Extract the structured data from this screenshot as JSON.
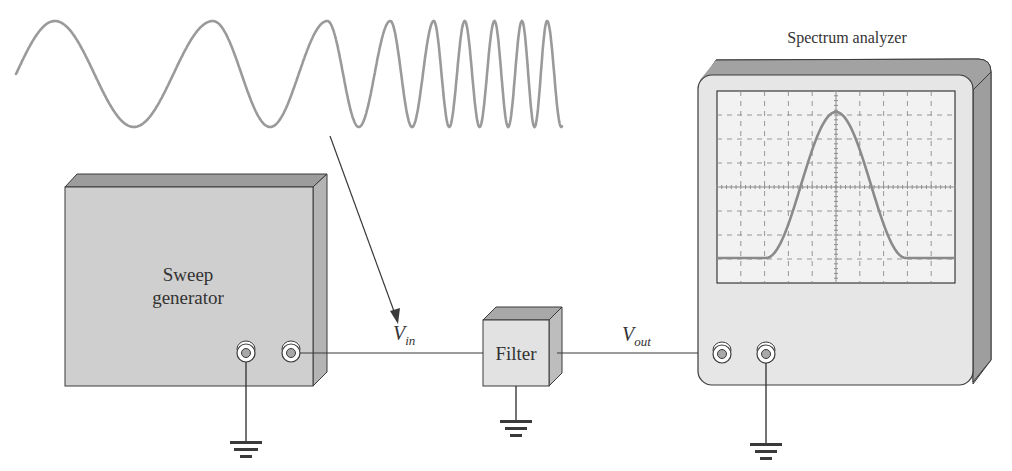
{
  "diagram": {
    "colors": {
      "wave": "#9a9a9a",
      "box_front": "#cfcfcf",
      "box_top": "#9c9c9c",
      "box_side": "#b4b4b4",
      "filter_front": "#e2e2e2",
      "analyzer_front": "#e6e6e6",
      "analyzer_screen": "#f2f2f2",
      "trace": "#8a8a8a",
      "line": "#3a3a3a"
    },
    "sweep_signal": {
      "label": "swept sine input (frequency increasing left to right)"
    },
    "sweep_generator": {
      "line1": "Sweep",
      "line2": "generator"
    },
    "filter": {
      "label": "Filter"
    },
    "spectrum_analyzer": {
      "label": "Spectrum analyzer"
    },
    "signals": {
      "vin_main": "V",
      "vin_sub": "in",
      "vout_main": "V",
      "vout_sub": "out"
    }
  }
}
